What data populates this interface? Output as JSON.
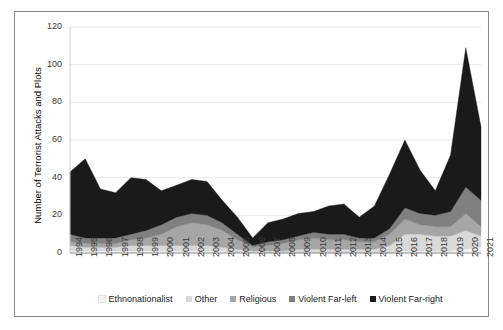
{
  "chart_data": {
    "type": "area",
    "title": "",
    "xlabel": "",
    "ylabel": "Number of Terrorist Attacks and Plots",
    "ylim": [
      0,
      120
    ],
    "yticks": [
      0,
      20,
      40,
      60,
      80,
      100,
      120
    ],
    "grid": true,
    "stacked": true,
    "legend_position": "bottom",
    "categories": [
      "1994",
      "1995",
      "1996",
      "1997",
      "1998",
      "1999",
      "2000",
      "2001",
      "2002",
      "2003",
      "2004",
      "2005",
      "2006",
      "2007",
      "2008",
      "2009",
      "2010",
      "2011",
      "2012",
      "2013",
      "2014",
      "2015",
      "2016",
      "2017",
      "2018",
      "2019",
      "2020",
      "2021"
    ],
    "series": [
      {
        "name": "Ethnonationalist",
        "color": "#f2f2f2",
        "values": [
          1,
          1,
          1,
          1,
          1,
          1,
          1,
          1,
          1,
          1,
          1,
          0,
          0,
          0,
          0,
          0,
          0,
          0,
          0,
          0,
          0,
          0,
          1,
          1,
          1,
          1,
          2,
          3
        ]
      },
      {
        "name": "Other",
        "color": "#d9d9d9",
        "values": [
          3,
          2,
          2,
          2,
          3,
          3,
          3,
          3,
          3,
          3,
          2,
          2,
          1,
          1,
          1,
          2,
          2,
          2,
          2,
          2,
          2,
          4,
          9,
          9,
          8,
          8,
          10,
          6
        ]
      },
      {
        "name": "Religious",
        "color": "#a6a6a6",
        "values": [
          2,
          2,
          2,
          2,
          3,
          4,
          6,
          10,
          12,
          11,
          9,
          5,
          2,
          3,
          4,
          5,
          6,
          5,
          5,
          4,
          4,
          6,
          8,
          5,
          5,
          5,
          9,
          5
        ]
      },
      {
        "name": "Violent Far-left",
        "color": "#808080",
        "values": [
          4,
          3,
          3,
          3,
          3,
          4,
          5,
          5,
          5,
          5,
          4,
          3,
          1,
          2,
          2,
          2,
          3,
          3,
          3,
          2,
          2,
          3,
          6,
          6,
          6,
          8,
          14,
          14
        ]
      },
      {
        "name": "Violent Far-right",
        "color": "#1a1a1a",
        "values": [
          33,
          42,
          26,
          24,
          30,
          27,
          18,
          17,
          18,
          18,
          12,
          9,
          4,
          10,
          11,
          12,
          11,
          15,
          16,
          11,
          17,
          29,
          36,
          23,
          13,
          30,
          74,
          39
        ]
      }
    ],
    "totals": [
      43,
      50,
      34,
      32,
      40,
      39,
      33,
      36,
      39,
      38,
      28,
      19,
      8,
      16,
      18,
      21,
      22,
      25,
      26,
      19,
      25,
      42,
      60,
      44,
      33,
      52,
      109,
      67
    ]
  },
  "legend": {
    "items": [
      {
        "label": "Ethnonationalist",
        "color": "#f2f2f2"
      },
      {
        "label": "Other",
        "color": "#d9d9d9"
      },
      {
        "label": "Religious",
        "color": "#a6a6a6"
      },
      {
        "label": "Violent Far-left",
        "color": "#808080"
      },
      {
        "label": "Violent Far-right",
        "color": "#1a1a1a"
      }
    ]
  },
  "axes": {
    "y_label": "Number of Terrorist Attacks and Plots"
  }
}
